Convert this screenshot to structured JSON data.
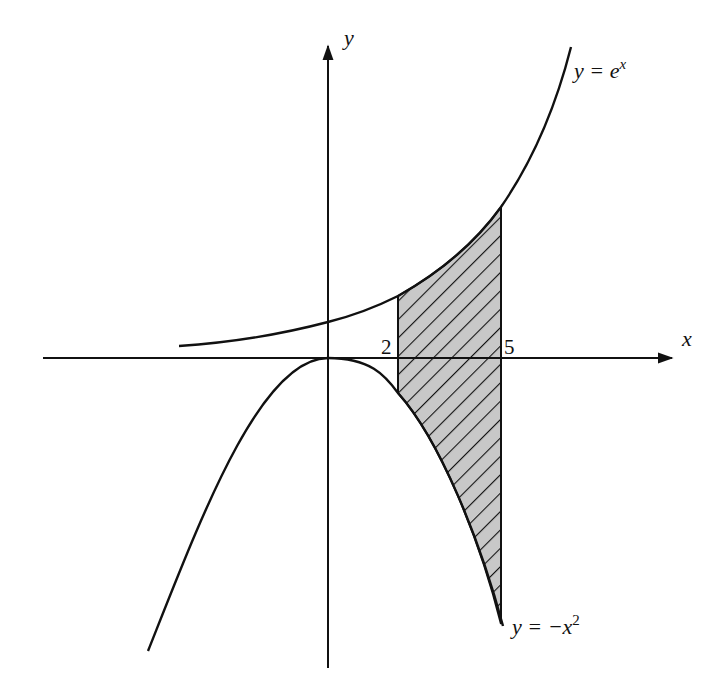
{
  "figure": {
    "axes": {
      "x_label": "x",
      "y_label": "y"
    },
    "curves": [
      {
        "id": "exp",
        "label_y": "y = ",
        "label_base": "e",
        "label_sup": "x",
        "equation": "y = e^x"
      },
      {
        "id": "parabola",
        "label_y": "y = ",
        "label_base": "−x",
        "label_sup": "2",
        "equation": "y = -x^2"
      }
    ],
    "ticks": [
      {
        "value": "2"
      },
      {
        "value": "5"
      }
    ],
    "shaded_region": {
      "description": "Region between y = e^x (top) and y = -x^2 (bottom) from x = 2 to x = 5",
      "fill": "#c8c8c8",
      "hatch": "diagonal lines"
    },
    "colors": {
      "stroke": "#111111",
      "background": "#ffffff",
      "shade": "#c8c8c8"
    }
  }
}
